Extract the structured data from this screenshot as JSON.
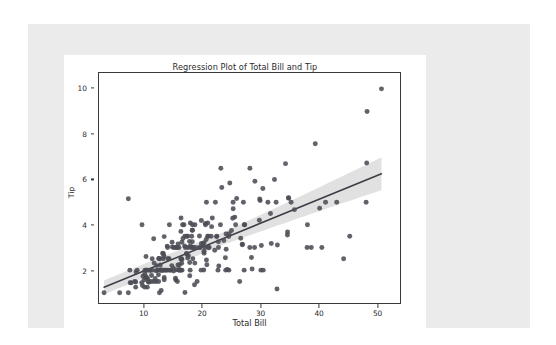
{
  "colors": {
    "page_background": "#ffffff",
    "panel_background": "#ebebeb",
    "figure_background": "#ffffff",
    "axes_edge": "#3a3a3a",
    "point_fill": "#4c4c55",
    "line_color": "#3c3c46",
    "ci_band": "#c9c9c9",
    "text": "#2b2b2b"
  },
  "chart_data": {
    "type": "scatter",
    "title": "Regression Plot of Total Bill and Tip",
    "xlabel": "Total Bill",
    "ylabel": "Tip",
    "xlim": [
      2.2,
      54.0
    ],
    "ylim": [
      0.55,
      10.7
    ],
    "xticks": [
      10,
      20,
      30,
      40,
      50
    ],
    "yticks": [
      2,
      4,
      6,
      8,
      10
    ],
    "grid": false,
    "legend": null,
    "regression": {
      "slope": 0.105,
      "intercept": 0.92,
      "ci_level": 95,
      "ci_halfwidth_at_xmin": 0.3,
      "ci_halfwidth_at_xmax": 0.62,
      "line_endpoints": [
        [
          3.07,
          1.243
        ],
        [
          50.81,
          6.255
        ]
      ]
    },
    "x": [
      16.99,
      10.34,
      21.01,
      23.68,
      24.59,
      25.29,
      8.77,
      26.88,
      15.04,
      14.78,
      10.27,
      35.26,
      15.42,
      18.43,
      14.83,
      21.58,
      10.33,
      16.29,
      16.97,
      20.65,
      17.92,
      20.29,
      15.77,
      39.42,
      19.82,
      17.81,
      13.37,
      12.69,
      21.7,
      19.65,
      9.55,
      18.35,
      15.06,
      20.69,
      17.78,
      24.06,
      16.31,
      16.93,
      18.69,
      31.27,
      16.04,
      17.46,
      13.94,
      9.68,
      30.4,
      18.29,
      22.23,
      32.4,
      28.55,
      18.04,
      12.54,
      10.29,
      34.81,
      9.94,
      25.56,
      19.49,
      38.01,
      26.41,
      11.24,
      48.27,
      20.29,
      13.81,
      11.02,
      18.29,
      17.59,
      20.08,
      16.45,
      3.07,
      20.23,
      15.01,
      12.02,
      17.07,
      26.86,
      25.28,
      14.73,
      10.51,
      17.92,
      27.2,
      22.76,
      17.29,
      19.44,
      16.66,
      10.07,
      32.68,
      15.98,
      34.83,
      13.03,
      18.28,
      24.71,
      21.16,
      28.97,
      22.49,
      5.75,
      16.32,
      22.75,
      40.17,
      27.28,
      12.03,
      21.01,
      12.46,
      11.35,
      15.38,
      44.3,
      22.42,
      20.92,
      15.36,
      20.49,
      25.21,
      18.24,
      14.31,
      14.0,
      7.25,
      38.07,
      23.95,
      25.71,
      17.31,
      29.93,
      10.65,
      12.43,
      24.08,
      11.69,
      13.42,
      14.26,
      15.95,
      12.48,
      29.8,
      8.52,
      14.52,
      11.38,
      22.82,
      19.08,
      20.27,
      11.17,
      12.26,
      18.26,
      8.51,
      10.33,
      14.15,
      16.0,
      13.16,
      17.47,
      34.3,
      41.19,
      27.05,
      16.43,
      8.35,
      18.64,
      11.87,
      9.78,
      7.51,
      14.07,
      13.13,
      17.26,
      24.55,
      19.77,
      29.85,
      48.17,
      25.0,
      13.39,
      16.49,
      21.5,
      12.66,
      16.21,
      13.81,
      17.51,
      24.52,
      20.76,
      31.71,
      10.59,
      10.63,
      50.81,
      15.81,
      7.25,
      31.85,
      16.82,
      32.9,
      17.89,
      14.48,
      9.6,
      34.63,
      34.65,
      23.33,
      45.35,
      23.17,
      40.55,
      20.69,
      20.9,
      30.46,
      18.15,
      23.1,
      15.69,
      19.81,
      28.44,
      15.48,
      16.58,
      7.56,
      10.34,
      43.11,
      13.0,
      13.51,
      18.71,
      12.74,
      13.0,
      16.4,
      20.53,
      16.47,
      26.59,
      38.73,
      24.27,
      12.76,
      30.06,
      25.89,
      48.33,
      13.27,
      28.17,
      12.9,
      28.15,
      11.59,
      7.74,
      30.14,
      12.16,
      13.42,
      8.58,
      15.98,
      13.42,
      16.27,
      10.09,
      20.45,
      13.28,
      22.12,
      24.01,
      15.69,
      11.61,
      10.77,
      15.53,
      10.07,
      12.6,
      32.83,
      35.83,
      29.03,
      27.18,
      22.67,
      17.82,
      18.78
    ],
    "y": [
      1.01,
      1.66,
      3.5,
      3.31,
      3.61,
      4.71,
      2.0,
      3.12,
      1.96,
      3.23,
      1.71,
      5.0,
      1.57,
      3.0,
      3.02,
      3.92,
      1.67,
      3.71,
      3.5,
      3.35,
      4.08,
      2.75,
      2.23,
      7.58,
      3.18,
      2.34,
      2.0,
      2.0,
      4.3,
      3.0,
      1.45,
      2.5,
      3.0,
      2.45,
      3.27,
      3.6,
      2.0,
      3.07,
      2.31,
      5.0,
      2.24,
      2.54,
      3.06,
      1.32,
      5.6,
      3.0,
      5.0,
      6.0,
      2.05,
      3.0,
      2.5,
      2.6,
      5.2,
      1.56,
      4.34,
      3.51,
      3.0,
      1.5,
      1.76,
      6.73,
      3.21,
      2.0,
      1.98,
      3.76,
      2.64,
      3.15,
      2.47,
      1.0,
      2.01,
      2.09,
      1.97,
      3.0,
      3.14,
      5.0,
      2.2,
      1.25,
      3.08,
      4.0,
      3.0,
      2.71,
      3.0,
      3.4,
      1.83,
      5.0,
      2.03,
      5.17,
      2.0,
      4.0,
      5.85,
      3.0,
      3.0,
      3.5,
      1.0,
      4.3,
      3.25,
      4.73,
      4.0,
      1.5,
      3.0,
      1.5,
      2.5,
      3.0,
      2.5,
      3.48,
      4.08,
      1.64,
      4.06,
      4.29,
      3.76,
      4.0,
      3.0,
      1.0,
      4.0,
      2.55,
      4.0,
      3.5,
      5.07,
      1.5,
      1.8,
      2.92,
      2.31,
      1.68,
      2.5,
      2.0,
      2.52,
      4.2,
      1.48,
      2.0,
      2.0,
      2.18,
      1.5,
      2.83,
      1.5,
      2.0,
      3.25,
      1.25,
      2.0,
      2.0,
      2.0,
      2.75,
      3.5,
      6.7,
      5.0,
      5.0,
      2.3,
      1.5,
      1.36,
      1.63,
      1.73,
      2.0,
      2.5,
      2.0,
      2.74,
      2.0,
      2.0,
      5.14,
      5.0,
      3.75,
      2.61,
      2.0,
      3.5,
      2.5,
      2.0,
      2.0,
      3.0,
      3.48,
      2.24,
      4.5,
      1.61,
      2.0,
      10.0,
      3.16,
      5.15,
      3.18,
      4.0,
      3.11,
      2.0,
      2.0,
      4.0,
      3.55,
      3.68,
      5.65,
      3.5,
      6.5,
      3.0,
      5.0,
      3.5,
      2.0,
      3.5,
      4.0,
      1.5,
      4.19,
      2.56,
      2.02,
      4.0,
      1.44,
      2.0,
      5.0,
      2.0,
      2.0,
      4.0,
      2.01,
      2.0,
      2.5,
      4.0,
      3.23,
      3.41,
      3.0,
      2.03,
      2.23,
      2.0,
      5.16,
      9.0,
      2.5,
      6.5,
      1.1,
      3.0,
      1.5,
      1.44,
      3.09,
      2.2,
      3.48,
      1.92,
      3.0,
      1.58,
      2.5,
      2.0,
      3.0,
      2.72,
      2.88,
      2.0,
      3.0,
      3.39,
      1.47,
      3.0,
      1.25,
      1.0,
      1.17,
      4.67,
      5.92,
      2.0,
      2.0,
      1.75,
      3.0
    ]
  }
}
